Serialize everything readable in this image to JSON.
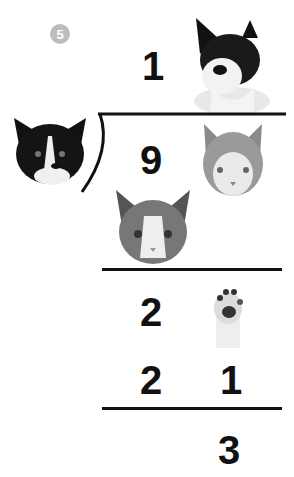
{
  "problem_number": "5",
  "division": {
    "quotient": [
      "1",
      "cat"
    ],
    "divisor": "cat",
    "dividend": [
      "9",
      "cat"
    ],
    "subtract_1": [
      "cat"
    ],
    "remainder_row": [
      "2",
      "paw"
    ],
    "subtract_2": [
      "2",
      "1"
    ],
    "result": [
      "",
      "3"
    ]
  },
  "labels": {
    "quotient_digit": "1",
    "dividend_digit": "9",
    "row3_digit": "2",
    "row4_digit_a": "2",
    "row4_digit_b": "1",
    "result_digit": "3"
  },
  "images": {
    "quotient_cat": "black-and-white-cat-lying",
    "divisor_cat": "tuxedo-cat-face",
    "dividend_cat": "tabby-white-cat-face",
    "subtrahend_cat": "tabby-cat-face",
    "paw": "cat-paw"
  }
}
